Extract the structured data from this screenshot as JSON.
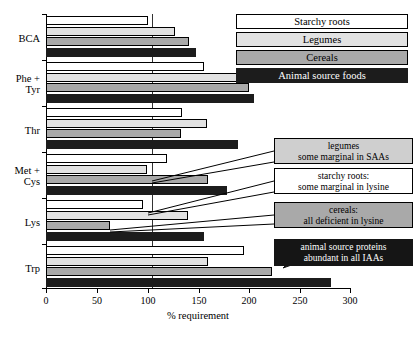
{
  "chart_data": {
    "type": "bar",
    "orientation": "horizontal",
    "title": "",
    "xlabel": "% requirement",
    "ylabel": "",
    "xlim": [
      0,
      300
    ],
    "xticks": [
      0,
      50,
      100,
      150,
      200,
      250,
      300
    ],
    "xtick_labels": [
      "0",
      "50",
      "100",
      "150",
      "200",
      "250",
      "300"
    ],
    "reference_line": 100,
    "grid": false,
    "legend_position": "top-right",
    "categories": [
      "BCA",
      "Phe + Tyr",
      "Thr",
      "Met + Cys",
      "Lys",
      "Trp"
    ],
    "series": [
      {
        "name": "Starchy roots",
        "color": "#ffffff",
        "values": [
          101,
          156,
          134,
          119,
          96,
          195
        ]
      },
      {
        "name": "Legumes",
        "color": "#e2e2e2",
        "values": [
          127,
          195,
          159,
          100,
          140,
          160
        ]
      },
      {
        "name": "Cereals",
        "color": "#a9a9a9",
        "values": [
          141,
          200,
          133,
          160,
          63,
          223
        ]
      },
      {
        "name": "Animal source foods",
        "color": "#1c1c1c",
        "values": [
          148,
          205,
          189,
          179,
          156,
          281
        ]
      }
    ],
    "annotations": [
      {
        "id": "legumes-note",
        "lines": [
          "legumes",
          "some marginal in SAAs"
        ],
        "style": "legumes"
      },
      {
        "id": "starchy-note",
        "lines": [
          "starchy roots:",
          "some marginal in lysine"
        ],
        "style": "starchy"
      },
      {
        "id": "cereals-note",
        "lines": [
          "cereals:",
          "all deficient in lysine"
        ],
        "style": "cereals"
      },
      {
        "id": "animal-note",
        "lines": [
          "animal source proteins",
          "abundant in all IAAs"
        ],
        "style": "animal"
      }
    ]
  },
  "axis": {
    "x_title": "% requirement",
    "tick_0": "0",
    "tick_50": "50",
    "tick_100": "100",
    "tick_150": "150",
    "tick_200": "200",
    "tick_250": "250",
    "tick_300": "300"
  },
  "categories": {
    "bca": "BCA",
    "phe_tyr_line1": "Phe +",
    "phe_tyr_line2": "Tyr",
    "thr": "Thr",
    "met_cys_line1": "Met +",
    "met_cys_line2": "Cys",
    "lys": "Lys",
    "trp": "Trp"
  },
  "legend": {
    "starchy": "Starchy roots",
    "legumes": "Legumes",
    "cereals": "Cereals",
    "animal": "Animal source foods"
  },
  "callouts": {
    "legumes_l1": "legumes",
    "legumes_l2": "some marginal in SAAs",
    "starchy_l1": "starchy roots:",
    "starchy_l2": "some marginal in lysine",
    "cereals_l1": "cereals:",
    "cereals_l2": "all deficient in lysine",
    "animal_l1": "animal source proteins",
    "animal_l2": "abundant in all IAAs"
  },
  "colors": {
    "starchy": "#ffffff",
    "legumes": "#e2e2e2",
    "cereals": "#a9a9a9",
    "animal": "#1c1c1c",
    "axis": "#000000",
    "reference_line": "#333333"
  }
}
